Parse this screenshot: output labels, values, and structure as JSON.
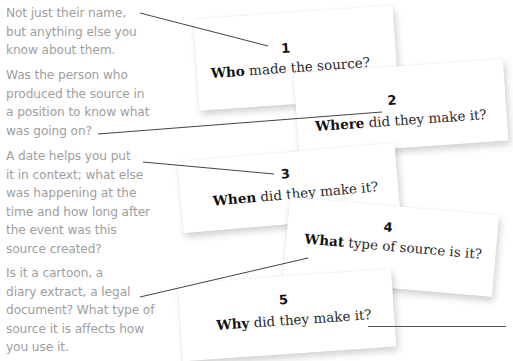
{
  "annotations": [
    {
      "id": "who-note",
      "text": "Not just their name,\nbut anything else you\nknow about them."
    },
    {
      "id": "where-note",
      "text": "Was the person who\nproduced the source in\na position to know what\nwas going on?"
    },
    {
      "id": "when-note",
      "text": "A date helps you put\nit in context; what else\nwas happening at the\ntime and how long after\nthe event was this\nsource created?"
    },
    {
      "id": "what-note",
      "text": "Is it a cartoon, a\ndiary extract, a legal\ndocument? What type of\nsource it is affects how\nyou use it."
    }
  ],
  "cards": [
    {
      "number": "1",
      "keyword": "Who",
      "rest": " made the source?"
    },
    {
      "number": "2",
      "keyword": "Where",
      "rest": " did they make it?"
    },
    {
      "number": "3",
      "keyword": "When",
      "rest": " did they make it?"
    },
    {
      "number": "4",
      "keyword": "What",
      "rest": " type of source is it?"
    },
    {
      "number": "5",
      "keyword": "Why",
      "rest": " did they make it?"
    }
  ],
  "colors": {
    "annotation_text": "#9e9e9e",
    "card_background": "#ffffff",
    "leader_line": "#444444"
  }
}
